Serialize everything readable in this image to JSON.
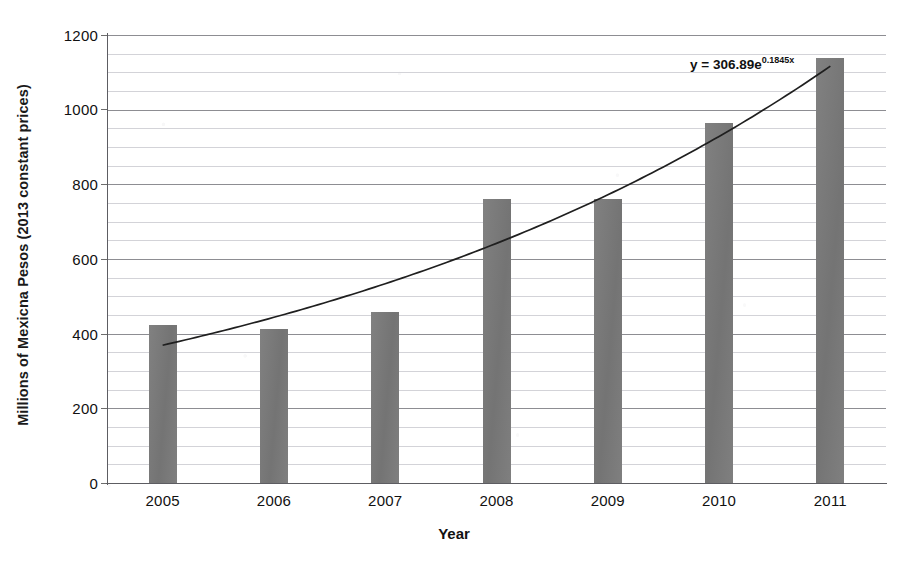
{
  "chart_data": {
    "type": "bar",
    "title": "",
    "xlabel": "Year",
    "ylabel": "Millions of Mexicna Pesos (2013 constant prices)",
    "categories": [
      "2005",
      "2006",
      "2007",
      "2008",
      "2009",
      "2010",
      "2011"
    ],
    "values": [
      423,
      413,
      458,
      761,
      761,
      965,
      1139
    ],
    "series": [
      {
        "name": "Value",
        "type": "bar",
        "values": [
          423,
          413,
          458,
          761,
          761,
          965,
          1139
        ]
      },
      {
        "name": "Exponential trendline",
        "type": "line",
        "equation": "y = 306.89e^0.1845x",
        "coefficient": 306.89,
        "exponent_rate": 0.1845,
        "values": [
          369,
          444,
          534,
          643,
          773,
          930,
          1119
        ]
      }
    ],
    "ylim": [
      0,
      1200
    ],
    "ytick_values": [
      0,
      200,
      400,
      600,
      800,
      1000,
      1200
    ],
    "ytick_labels": [
      "0",
      "200",
      "400",
      "600",
      "800",
      "1000",
      "1200"
    ],
    "minor_tick_step": 50,
    "grid": true,
    "grid_axis": "y",
    "legend": false,
    "legend_position": "none",
    "bar_color": "#7a7a7a",
    "trendline_color": "#1f1f1f",
    "background_color": "#ffffff"
  },
  "annotations": {
    "trendline_equation_base": "y = 306.89e",
    "trendline_equation_exponent": "0.1845x"
  }
}
